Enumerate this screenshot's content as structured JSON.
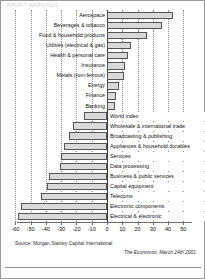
{
  "title": "PROFIT WARNINGS",
  "source": {
    "note": "Source: Morgan Stanley Capital International",
    "credit": "The Economist, March 24th 2001"
  },
  "chart_data": {
    "type": "bar",
    "orientation": "horizontal",
    "title": "PROFIT WARNINGS",
    "xlabel": "",
    "ylabel": "",
    "xlim": [
      -60,
      50
    ],
    "grid": true,
    "gridlines": [
      -60,
      -50,
      -40,
      -30,
      -20,
      -10,
      0,
      10,
      20,
      30,
      40,
      50
    ],
    "tick_labels": [
      "-60",
      "-50",
      "-40",
      "-30",
      "-20",
      "-10",
      "0",
      "10",
      "20",
      "30",
      "40",
      "50"
    ],
    "legend": "none",
    "categories": [
      "Aerospace",
      "Beverages & tobacco",
      "Food & household products",
      "Utilities (electrical & gas)",
      "Health & personal care",
      "Insurance",
      "Metals (non-ferrous)",
      "Energy",
      "Finance",
      "Banking",
      "World index",
      "Wholesale & international trade",
      "Broadcasting & publishing",
      "Appliances & household durables",
      "Services",
      "Data processing",
      "Business & public services",
      "Capital equipment",
      "Telecoms",
      "Electronic components",
      "Electrical & electronic"
    ],
    "values": [
      43,
      36,
      26,
      16,
      14,
      12,
      11,
      8,
      6,
      5,
      -15,
      -22,
      -25,
      -28,
      -30,
      -31,
      -38,
      -39,
      -43,
      -56,
      -58
    ]
  }
}
